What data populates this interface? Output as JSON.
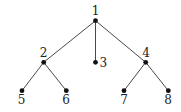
{
  "diagram": {
    "type": "tree",
    "colors": {
      "edge": "#333333",
      "node": "#111111",
      "label": "#222222"
    },
    "nodes": [
      {
        "id": "1",
        "label": "1",
        "x": 95.5,
        "y": 20.7,
        "lx": 95.5,
        "ly": 15,
        "anchor": "middle"
      },
      {
        "id": "2",
        "label": "2",
        "x": 43.7,
        "y": 62.3,
        "lx": 43.5,
        "ly": 56.5,
        "anchor": "middle"
      },
      {
        "id": "3",
        "label": "3",
        "x": 95.5,
        "y": 62.3,
        "lx": 99.5,
        "ly": 66.5,
        "anchor": "start"
      },
      {
        "id": "4",
        "label": "4",
        "x": 145.7,
        "y": 62.3,
        "lx": 146,
        "ly": 56.5,
        "anchor": "middle"
      },
      {
        "id": "5",
        "label": "5",
        "x": 22,
        "y": 90.7,
        "lx": 21.5,
        "ly": 104,
        "anchor": "middle"
      },
      {
        "id": "6",
        "label": "6",
        "x": 66.3,
        "y": 90.7,
        "lx": 66,
        "ly": 104,
        "anchor": "middle"
      },
      {
        "id": "7",
        "label": "7",
        "x": 124,
        "y": 90.7,
        "lx": 124,
        "ly": 104,
        "anchor": "middle"
      },
      {
        "id": "8",
        "label": "8",
        "x": 168.3,
        "y": 90.7,
        "lx": 168,
        "ly": 104,
        "anchor": "middle"
      }
    ],
    "edges": [
      [
        "1",
        "2"
      ],
      [
        "1",
        "3"
      ],
      [
        "1",
        "4"
      ],
      [
        "2",
        "5"
      ],
      [
        "2",
        "6"
      ],
      [
        "4",
        "7"
      ],
      [
        "4",
        "8"
      ]
    ]
  }
}
